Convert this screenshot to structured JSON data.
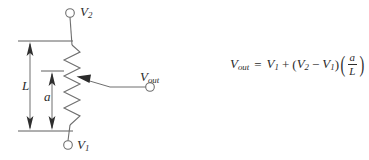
{
  "figure": {
    "type": "potentiometer-voltage-divider-schematic",
    "background_color": "#ffffff",
    "line_color": "#6e6e6e",
    "text_color": "#2b2b2b"
  },
  "circuit": {
    "terminals": [
      {
        "id": "v2",
        "label_main": "V",
        "label_sub": "2",
        "x": 70,
        "y": 13
      },
      {
        "id": "v1",
        "label_main": "V",
        "label_sub": "1",
        "x": 68,
        "y": 145
      },
      {
        "id": "vout",
        "label_main": "V",
        "label_sub": "out",
        "x": 150,
        "y": 87
      }
    ],
    "resistor": {
      "name": "potentiometer-resistor",
      "top_y": 45,
      "bottom_y": 125,
      "center_x": 72,
      "zig_amplitude": 8,
      "segments": 10
    },
    "wiper": {
      "name": "wiper-arrow",
      "tip_x": 77,
      "tip_y": 77,
      "elbow_x": 110,
      "elbow_y": 87,
      "end_x": 146,
      "end_y": 87
    }
  },
  "dimensions": [
    {
      "id": "L",
      "label": "L",
      "x": 30,
      "top_y": 41,
      "bottom_y": 131,
      "tick_line_from_x": 18,
      "tick_line_to_x": 73
    },
    {
      "id": "a",
      "label": "a",
      "x": 52,
      "top_y": 71,
      "bottom_y": 131,
      "tick_line_from_x": 41,
      "tick_line_to_x": 64
    }
  ],
  "equation": {
    "name": "vout-equation",
    "plain_text": "V_out = V_1 + (V_2 - V_1)(a/L)",
    "lhs_var": "V",
    "lhs_sub": "out",
    "equals": "=",
    "term1_var": "V",
    "term1_sub": "1",
    "plus": "+",
    "open_paren": "(",
    "term2_var": "V",
    "term2_sub": "2",
    "minus": "−",
    "term3_var": "V",
    "term3_sub": "1",
    "close_paren": ")",
    "big_open_paren": "(",
    "fraction_numerator": "a",
    "fraction_denominator": "L",
    "big_close_paren": ")"
  }
}
